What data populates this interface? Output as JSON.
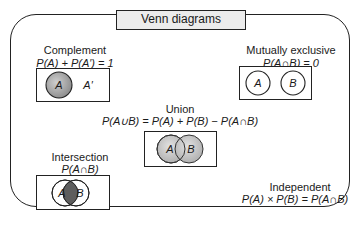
{
  "title": "Venn diagrams",
  "colors": {
    "shade_light": "#e6e6e6",
    "shade_mid": "#a8a8a8",
    "shade_dark": "#6a6a6a",
    "stroke": "#222222",
    "title_bg": "#ececec"
  },
  "panels": {
    "complement": {
      "label": "Complement",
      "formula": "P(A) + P(A′) = 1",
      "set_a": "A",
      "set_a_prime": "A′"
    },
    "mutually_exclusive": {
      "label": "Mutually exclusive",
      "formula": "P(A∩B) = 0",
      "set_a": "A",
      "set_b": "B"
    },
    "union": {
      "label": "Union",
      "formula": "P(A∪B) = P(A) + P(B) − P(A∩B)",
      "set_a": "A",
      "set_b": "B"
    },
    "intersection": {
      "label": "Intersection",
      "formula": "P(A∩B)",
      "set_a": "A",
      "set_b": "B"
    },
    "independent": {
      "label": "Independent",
      "formula": "P(A) × P(B) = P(A∩B)"
    }
  }
}
